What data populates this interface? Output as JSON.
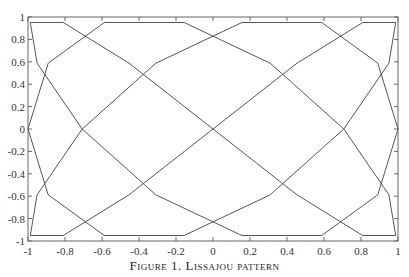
{
  "chart_data": {
    "type": "line",
    "title": "",
    "xlabel": "",
    "ylabel": "",
    "xlim": [
      -1,
      1
    ],
    "ylim": [
      -1,
      1
    ],
    "grid": false,
    "legend": null,
    "x_ticks": [
      "-1",
      "-0.8",
      "-0.6",
      "-0.4",
      "-0.2",
      "0",
      "0.2",
      "0.4",
      "0.6",
      "0.8",
      "1"
    ],
    "y_ticks": [
      "1",
      "0.8",
      "0.6",
      "0.4",
      "0.2",
      "0",
      "-0.2",
      "-0.4",
      "-0.6",
      "-0.8",
      "-1"
    ],
    "series": [
      {
        "name": "Lissajou curve",
        "parametric": {
          "x": "sin(3t)",
          "y": "sin(4t)",
          "t_range": [
            0,
            6.2832
          ],
          "samples": 41
        },
        "color": "#555555"
      }
    ]
  },
  "caption": "Figure 1. Lissajou pattern"
}
